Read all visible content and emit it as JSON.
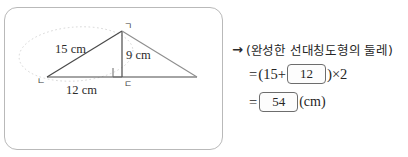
{
  "figure": {
    "caption_labels": {
      "side_15": "15 cm",
      "height_9": "9 cm",
      "base_12": "12 cm"
    },
    "vertices": {
      "top": "ㄱ",
      "bottom_left": "ㄴ",
      "bottom_mid": "ㄷ"
    },
    "colors": {
      "panel_border": "#b9b9b9",
      "stroke": "#4a4a4a",
      "mirror_stroke": "#8e8e8e",
      "guide_dotted": "#c9c9c9"
    }
  },
  "solution": {
    "arrow": "→",
    "statement": "(완성한 선대칭도형의 둘레)",
    "eq1": {
      "equals": "=",
      "open_paren": "(",
      "first_term": "15",
      "plus": "+",
      "answer": "12",
      "close_paren": ")",
      "times": "×",
      "multiplier": "2"
    },
    "eq2": {
      "equals": "=",
      "answer": "54",
      "unit": "(cm)"
    }
  }
}
